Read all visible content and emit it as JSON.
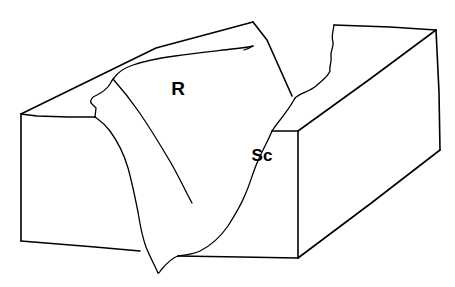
{
  "figure": {
    "kind": "geologic-block-diagram",
    "title": "",
    "background_color": "#ffffff",
    "stroke_color": "#000000",
    "width": 455,
    "height": 287
  },
  "labels": [
    {
      "id": "ridge",
      "text": "R",
      "x": 178,
      "y": 95,
      "meaning": "resistant ridge"
    },
    {
      "id": "scarp",
      "text": "Sc",
      "x": 262,
      "y": 161,
      "meaning": "scarp face"
    }
  ],
  "label_r": "R",
  "label_sc": "Sc",
  "geometry": {
    "left_block_front_face": "M21,114 L21,241",
    "notes": "isometric block with eroded valley, ridge surface and scarp face"
  }
}
